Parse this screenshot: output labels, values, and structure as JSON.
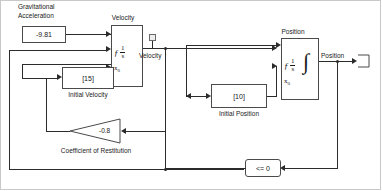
{
  "diagram": {
    "blocks": {
      "gravity": {
        "label_line1": "Gravitational",
        "label_line2": "Acceleration",
        "value": "-9.81",
        "type": "constant"
      },
      "initial_velocity": {
        "label": "Initial Velocity",
        "value": "[15]",
        "type": "constant"
      },
      "initial_position": {
        "label": "Initial Position",
        "value": "[10]",
        "type": "constant"
      },
      "coefficient_of_restitution": {
        "label": "Coefficient of Restitution",
        "value": "-0.8",
        "type": "gain"
      },
      "velocity_integrator": {
        "label": "Velocity",
        "numerator": "1",
        "denominator": "s",
        "integral_symbol": "∫",
        "reset_port": "ƒ",
        "initial_condition_port": "x",
        "initial_condition_sub": "0",
        "type": "integrator"
      },
      "position_integrator": {
        "label": "Position",
        "numerator": "1",
        "denominator": "s",
        "integral_symbol": "∫",
        "reset_port": "ƒ",
        "initial_condition_port": "x",
        "initial_condition_sub": "0",
        "type": "integrator"
      },
      "ground_compare": {
        "value": "<= 0",
        "type": "relational-operator"
      }
    },
    "signals": {
      "velocity": "Velocity",
      "position": "Position"
    },
    "colors": {
      "wire": "#2b2b2b",
      "block_border": "#4a4a4a",
      "text": "#1a1a1a",
      "background": "#ffffff",
      "frame": "#c9c9c9",
      "terminator_fill": "#ededed"
    }
  }
}
